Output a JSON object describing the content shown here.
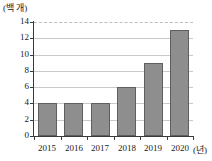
{
  "chart_data": {
    "type": "bar",
    "title": "",
    "subtitle": "",
    "categories": [
      "2015",
      "2016",
      "2017",
      "2018",
      "2019",
      "2020"
    ],
    "values": [
      4,
      4,
      4,
      6,
      9,
      13
    ],
    "series": [
      {
        "name": "",
        "values": [
          4,
          4,
          4,
          6,
          9,
          13
        ]
      }
    ],
    "xlabel": "(년)",
    "ylabel": "(백 개)",
    "ylim": [
      0,
      14
    ],
    "yticks": [
      0,
      2,
      4,
      6,
      8,
      10,
      12,
      14
    ],
    "ytick_labels": [
      "0",
      "2",
      "4",
      "6",
      "8",
      "10",
      "12",
      "14"
    ],
    "grid": true,
    "grid_axis": "y",
    "legend": false,
    "legend_position": "none",
    "annotations": [],
    "colors": {
      "bar_fill": "#8e8e8e",
      "bar_border": "#5f5f5f",
      "gridline": "#c9c9c9",
      "axis": "#3a3a3a",
      "text": "#1a1a1a",
      "background": "#ffffff"
    }
  }
}
